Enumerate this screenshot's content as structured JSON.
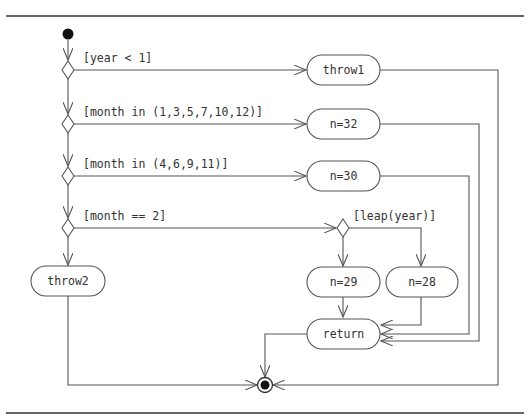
{
  "diagram": {
    "type": "uml-activity",
    "nodes": {
      "start": {
        "kind": "initial"
      },
      "d1": {
        "kind": "decision",
        "guard": "[year < 1]"
      },
      "d2": {
        "kind": "decision",
        "guard": "[month in (1,3,5,7,10,12)]"
      },
      "d3": {
        "kind": "decision",
        "guard": "[month in (4,6,9,11)]"
      },
      "d4": {
        "kind": "decision",
        "guard": "[month == 2]"
      },
      "d5": {
        "kind": "decision",
        "guard": "[leap(year)]"
      },
      "throw1": {
        "kind": "action",
        "label": "throw1"
      },
      "n32": {
        "kind": "action",
        "label": "n=32"
      },
      "n30": {
        "kind": "action",
        "label": "n=30"
      },
      "n29": {
        "kind": "action",
        "label": "n=29"
      },
      "n28": {
        "kind": "action",
        "label": "n=28"
      },
      "throw2": {
        "kind": "action",
        "label": "throw2"
      },
      "ret": {
        "kind": "action",
        "label": "return"
      },
      "end": {
        "kind": "final"
      }
    },
    "edges": [
      {
        "from": "start",
        "to": "d1"
      },
      {
        "from": "d1",
        "to": "throw1",
        "guard": "[year < 1]"
      },
      {
        "from": "d1",
        "to": "d2"
      },
      {
        "from": "d2",
        "to": "n32",
        "guard": "[month in (1,3,5,7,10,12)]"
      },
      {
        "from": "d2",
        "to": "d3"
      },
      {
        "from": "d3",
        "to": "n30",
        "guard": "[month in (4,6,9,11)]"
      },
      {
        "from": "d3",
        "to": "d4"
      },
      {
        "from": "d4",
        "to": "d5",
        "guard": "[month == 2]"
      },
      {
        "from": "d4",
        "to": "throw2"
      },
      {
        "from": "d5",
        "to": "n29"
      },
      {
        "from": "d5",
        "to": "n28",
        "guard": "[leap(year)]"
      },
      {
        "from": "n29",
        "to": "ret"
      },
      {
        "from": "n28",
        "to": "ret"
      },
      {
        "from": "n30",
        "to": "ret"
      },
      {
        "from": "n32",
        "to": "ret"
      },
      {
        "from": "ret",
        "to": "end"
      },
      {
        "from": "throw1",
        "to": "end"
      },
      {
        "from": "throw2",
        "to": "end"
      }
    ]
  },
  "colors": {
    "line": "#555555",
    "text": "#333333",
    "fill": "#ffffff",
    "node": "#111111"
  }
}
